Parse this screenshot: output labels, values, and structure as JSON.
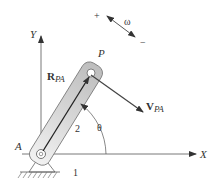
{
  "diagram": {
    "labels": {
      "x_axis": "X",
      "y_axis": "Y",
      "pivot": "A",
      "point": "P",
      "position_vector_main": "R",
      "position_vector_sub": "PA",
      "velocity_vector_main": "V",
      "velocity_vector_sub": "PA",
      "angle": "θ",
      "angular_velocity": "ω",
      "positive_sign": "+",
      "negative_sign": "−",
      "link_number": "2",
      "ground_number": "1"
    },
    "colors": {
      "line": "#333333",
      "link_fill": "#d9d9d9",
      "link_stroke": "#555555",
      "axis": "#444444",
      "background": "#ffffff"
    }
  }
}
